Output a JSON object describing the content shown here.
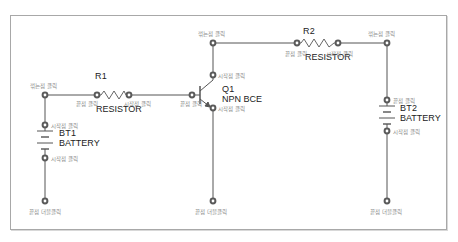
{
  "diagram": {
    "type": "schematic-wiring-guide",
    "colors": {
      "wire": "#555555",
      "node": "#5a5a5a",
      "frame": "#a8a8a8",
      "hint_text": "#8a8a8a",
      "label_text": "#222222"
    },
    "components": {
      "r1": {
        "ref": "R1",
        "value": "RESISTOR"
      },
      "r2": {
        "ref": "R2",
        "value": "RESISTOR"
      },
      "q1": {
        "ref": "Q1",
        "value": "NPN BCE"
      },
      "bt1": {
        "ref": "BT1",
        "value": "BATTERY"
      },
      "bt2": {
        "ref": "BT2",
        "value": "BATTERY"
      }
    },
    "hints": {
      "left_bend": "꺾는점 클릭",
      "r1_end": "끝점 클릭",
      "r1_start": "시작점 클릭",
      "q1_base_end": "끝점 클릭",
      "q1_top_bend": "꺾는점 클릭",
      "q1_collector_start": "시작점 클릭",
      "q1_emitter_start": "시작점 클릭",
      "bt1_top_start": "시작점 클릭",
      "bt1_bottom_start": "시작점 클릭",
      "bt1_bottom_end": "끝점 더블클릭",
      "q1_bottom_end": "끝점 더블클릭",
      "r2_end": "끝점 클릭",
      "r2_start": "시작점 클릭",
      "right_bend": "꺾는점 클릭",
      "bt2_top_end": "끝점 클릭",
      "bt2_bottom_start": "시작점 클릭",
      "bt2_bottom_end": "끝점 더블클릭"
    }
  }
}
